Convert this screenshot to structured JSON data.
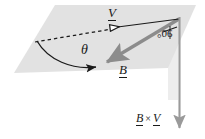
{
  "figure": {
    "type": "vector-diagram",
    "colors": {
      "plane_fill": "#e2e2e2",
      "vector_b_color": "#8c8c8c",
      "cross_arrow_color": "#9a9a9a",
      "line_color": "#1a1a1a",
      "band_fill": "#ededed",
      "background": "#ffffff"
    },
    "labels": {
      "vector_v": "V",
      "vector_b": "B",
      "angle_theta": "θ",
      "right_angle": "90°",
      "cross_product_left": "B",
      "cross_product_times": "×",
      "cross_product_right": "V"
    },
    "geometry": {
      "plane_corners": "55,5 196,5 168,68 14,73",
      "apex": "180,18",
      "vector_v_tip": "106,28",
      "vector_b_tip": "105,63",
      "theta_origin": "37,41",
      "cross_arrow_from": "180,18",
      "cross_arrow_to": "180,132"
    }
  }
}
